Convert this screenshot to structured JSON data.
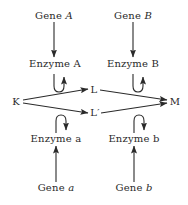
{
  "diagram": {
    "colors": {
      "ink": "#2a2a2a",
      "background": "#ffffff"
    },
    "nodes": {
      "gene_A": {
        "prefix": "Gene",
        "italic": "A"
      },
      "gene_B": {
        "prefix": "Gene",
        "italic": "B"
      },
      "enzyme_A": {
        "label": "Enzyme A"
      },
      "enzyme_B": {
        "label": "Enzyme B"
      },
      "K": {
        "label": "K"
      },
      "L": {
        "label": "L"
      },
      "L_prime": {
        "label": "L′"
      },
      "M": {
        "label": "M"
      },
      "enzyme_a": {
        "label": "Enzyme a"
      },
      "enzyme_b": {
        "label": "Enzyme b"
      },
      "gene_a": {
        "prefix": "Gene",
        "italic": "a"
      },
      "gene_b": {
        "prefix": "Gene",
        "italic": "b"
      }
    },
    "edges": [
      {
        "from": "Gene A",
        "to": "Enzyme A",
        "type": "arrow"
      },
      {
        "from": "Gene B",
        "to": "Enzyme B",
        "type": "arrow"
      },
      {
        "from": "Gene a",
        "to": "Enzyme a",
        "type": "arrow"
      },
      {
        "from": "Gene b",
        "to": "Enzyme b",
        "type": "arrow"
      },
      {
        "from": "K",
        "to": "L",
        "type": "arrow",
        "catalyst": "Enzyme A"
      },
      {
        "from": "K",
        "to": "L′",
        "type": "arrow",
        "catalyst": "Enzyme a"
      },
      {
        "from": "L",
        "to": "M",
        "type": "arrow",
        "catalyst": "Enzyme B"
      },
      {
        "from": "L′",
        "to": "M",
        "type": "arrow",
        "catalyst": "Enzyme b"
      }
    ]
  }
}
